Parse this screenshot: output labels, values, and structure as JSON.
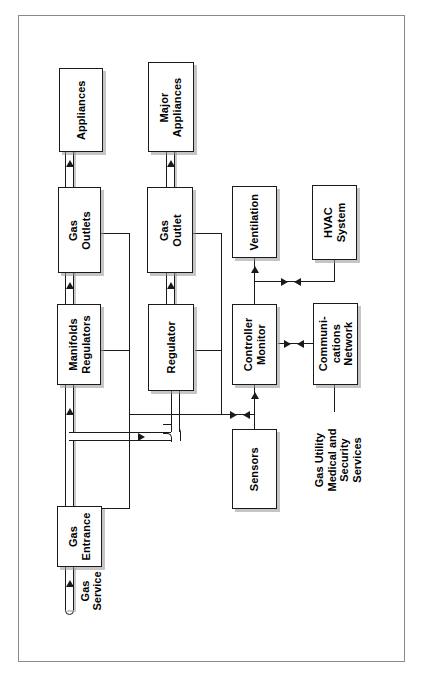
{
  "diagram": {
    "frame_color": "#8a8a8a",
    "line_color": "#1a1a1a",
    "box_fill": "#ffffff",
    "orientation": "rotated-90-ccw"
  },
  "nodes": {
    "appliances": {
      "label": "Appliances"
    },
    "major_appliances": {
      "label": "Major\nAppliances"
    },
    "gas_outlets": {
      "label": "Gas\nOutlets"
    },
    "gas_outlet": {
      "label": "Gas\nOutlet"
    },
    "manifolds_regulators": {
      "label": "Manifolds\nRegulators"
    },
    "regulator": {
      "label": "Regulator"
    },
    "gas_entrance": {
      "label": "Gas\nEntrance"
    },
    "ventilation": {
      "label": "Ventilation"
    },
    "hvac_system": {
      "label": "HVAC\nSystem"
    },
    "controller_monitor": {
      "label": "Controller\nMonitor"
    },
    "communications_network": {
      "label": "Communi-\ncations\nNetwork"
    },
    "sensors": {
      "label": "Sensors"
    }
  },
  "labels": {
    "gas_service": "Gas\nService",
    "external_services": "Gas Utility\nMedical and\nSecurity\nServices"
  },
  "connections": [
    {
      "from": "gas_entrance",
      "to": "manifolds_regulators",
      "kind": "gas-pipe",
      "arrow": "toward-manifolds"
    },
    {
      "from": "manifolds_regulators",
      "to": "gas_outlets",
      "kind": "gas-pipe",
      "arrow": "toward-outlets"
    },
    {
      "from": "gas_outlets",
      "to": "appliances",
      "kind": "gas-pipe",
      "arrow": "toward-appliances"
    },
    {
      "from": "gas_entrance",
      "to": "regulator",
      "kind": "gas-pipe",
      "arrow": "toward-regulator"
    },
    {
      "from": "regulator",
      "to": "gas_outlet",
      "kind": "gas-pipe",
      "arrow": "toward-outlet"
    },
    {
      "from": "gas_outlet",
      "to": "major_appliances",
      "kind": "gas-pipe",
      "arrow": "toward-major-appliances"
    },
    {
      "from": "gas_service",
      "to": "gas_entrance",
      "kind": "gas-pipe",
      "arrow": "toward-entrance"
    },
    {
      "from": "controller_monitor",
      "to": "ventilation",
      "kind": "signal",
      "arrow": "toward-ventilation"
    },
    {
      "from": "hvac_system",
      "to": "controller_monitor",
      "kind": "signal",
      "arrow": "bidirectional"
    },
    {
      "from": "controller_monitor",
      "to": "communications_network",
      "kind": "signal",
      "arrow": "bidirectional"
    },
    {
      "from": "sensors",
      "to": "controller_monitor",
      "kind": "signal",
      "arrow": "toward-controller"
    },
    {
      "from": "gas_entrance",
      "to": "controller_monitor",
      "kind": "signal",
      "arrow": "bidirectional"
    },
    {
      "from": "manifolds_regulators",
      "to": "controller_monitor",
      "kind": "signal",
      "arrow": "bidirectional"
    },
    {
      "from": "gas_outlets",
      "to": "controller_monitor",
      "kind": "signal",
      "arrow": "bidirectional"
    },
    {
      "from": "regulator",
      "to": "controller_monitor",
      "kind": "signal",
      "arrow": "bidirectional"
    },
    {
      "from": "gas_outlet",
      "to": "controller_monitor",
      "kind": "signal",
      "arrow": "bidirectional"
    },
    {
      "from": "communications_network",
      "to": "external_services",
      "kind": "signal",
      "arrow": "none"
    }
  ]
}
